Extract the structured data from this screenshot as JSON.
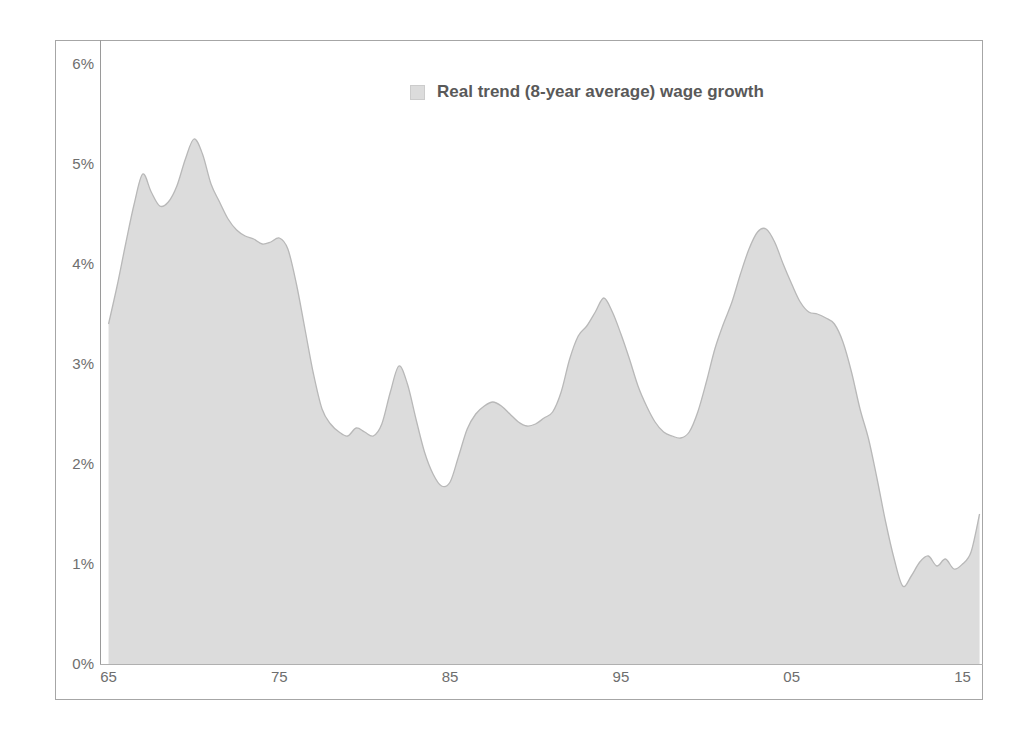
{
  "chart_data": {
    "type": "area",
    "title": "",
    "subtitle": "",
    "xlabel": "",
    "ylabel": "",
    "xlim": [
      1964.5,
      2016.2
    ],
    "ylim": [
      0,
      6
    ],
    "grid": false,
    "legend_position": "top-center",
    "legend": [
      "Real trend (8-year average) wage growth"
    ],
    "y_tick_labels": [
      "6%",
      "5%",
      "4%",
      "3%",
      "2%",
      "1%",
      "0%"
    ],
    "y_tick_values": [
      6,
      5,
      4,
      3,
      2,
      1,
      0
    ],
    "x_tick_labels": [
      "65",
      "75",
      "85",
      "95",
      "05",
      "15"
    ],
    "x_tick_values": [
      1965,
      1975,
      1985,
      1995,
      2005,
      2015
    ],
    "series": [
      {
        "name": "Real trend (8-year average) wage growth",
        "fill_color": "#dcdcdc",
        "line_color": "#b8b8b8",
        "x": [
          1965.0,
          1965.5,
          1966.0,
          1966.5,
          1967.0,
          1967.5,
          1968.0,
          1968.5,
          1969.0,
          1969.5,
          1970.0,
          1970.5,
          1971.0,
          1971.5,
          1972.0,
          1972.5,
          1973.0,
          1973.5,
          1974.0,
          1974.5,
          1975.0,
          1975.5,
          1976.0,
          1976.5,
          1977.0,
          1977.5,
          1978.0,
          1978.5,
          1979.0,
          1979.5,
          1980.0,
          1980.5,
          1981.0,
          1981.5,
          1982.0,
          1982.5,
          1983.0,
          1983.5,
          1984.0,
          1984.5,
          1985.0,
          1985.5,
          1986.0,
          1986.5,
          1987.0,
          1987.5,
          1988.0,
          1988.5,
          1989.0,
          1989.5,
          1990.0,
          1990.5,
          1991.0,
          1991.5,
          1992.0,
          1992.5,
          1993.0,
          1993.5,
          1994.0,
          1994.5,
          1995.0,
          1995.5,
          1996.0,
          1996.5,
          1997.0,
          1997.5,
          1998.0,
          1998.5,
          1999.0,
          1999.5,
          2000.0,
          2000.5,
          2001.0,
          2001.5,
          2002.0,
          2002.5,
          2003.0,
          2003.5,
          2004.0,
          2004.5,
          2005.0,
          2005.5,
          2006.0,
          2006.5,
          2007.0,
          2007.5,
          2008.0,
          2008.5,
          2009.0,
          2009.5,
          2010.0,
          2010.5,
          2011.0,
          2011.5,
          2012.0,
          2012.5,
          2013.0,
          2013.5,
          2014.0,
          2014.5,
          2015.0,
          2015.5,
          2016.0
        ],
        "y": [
          3.4,
          3.78,
          4.2,
          4.6,
          4.9,
          4.72,
          4.58,
          4.62,
          4.78,
          5.05,
          5.25,
          5.1,
          4.8,
          4.62,
          4.45,
          4.34,
          4.28,
          4.25,
          4.2,
          4.22,
          4.26,
          4.15,
          3.8,
          3.35,
          2.9,
          2.55,
          2.4,
          2.32,
          2.28,
          2.36,
          2.32,
          2.28,
          2.4,
          2.72,
          2.98,
          2.8,
          2.45,
          2.12,
          1.9,
          1.78,
          1.82,
          2.08,
          2.35,
          2.5,
          2.58,
          2.62,
          2.58,
          2.5,
          2.42,
          2.38,
          2.4,
          2.46,
          2.52,
          2.72,
          3.05,
          3.28,
          3.38,
          3.52,
          3.66,
          3.52,
          3.3,
          3.05,
          2.78,
          2.58,
          2.42,
          2.32,
          2.28,
          2.26,
          2.32,
          2.52,
          2.82,
          3.15,
          3.4,
          3.62,
          3.9,
          4.15,
          4.32,
          4.35,
          4.22,
          4.0,
          3.8,
          3.62,
          3.52,
          3.5,
          3.46,
          3.4,
          3.22,
          2.92,
          2.55,
          2.25,
          1.85,
          1.42,
          1.05,
          0.78,
          0.88,
          1.02,
          1.08,
          0.98,
          1.05,
          0.95,
          1.0,
          1.12,
          1.5
        ]
      }
    ]
  },
  "legend": {
    "label": "Real trend (8-year average) wage growth"
  },
  "axes": {
    "y_ticks": [
      {
        "label": "6%",
        "value": 6
      },
      {
        "label": "5%",
        "value": 5
      },
      {
        "label": "4%",
        "value": 4
      },
      {
        "label": "3%",
        "value": 3
      },
      {
        "label": "2%",
        "value": 2
      },
      {
        "label": "1%",
        "value": 1
      },
      {
        "label": "0%",
        "value": 0
      }
    ],
    "x_ticks": [
      {
        "label": "65",
        "value": 1965
      },
      {
        "label": "75",
        "value": 1975
      },
      {
        "label": "85",
        "value": 1985
      },
      {
        "label": "95",
        "value": 1995
      },
      {
        "label": "05",
        "value": 2005
      },
      {
        "label": "15",
        "value": 2015
      }
    ]
  },
  "colors": {
    "area_fill": "#dcdcdc",
    "area_line": "#b8b8b8",
    "frame_border": "#a6a6a6",
    "axis_line": "#9a9a9a",
    "tick_text": "#6e6e6e",
    "legend_text": "#595959"
  }
}
